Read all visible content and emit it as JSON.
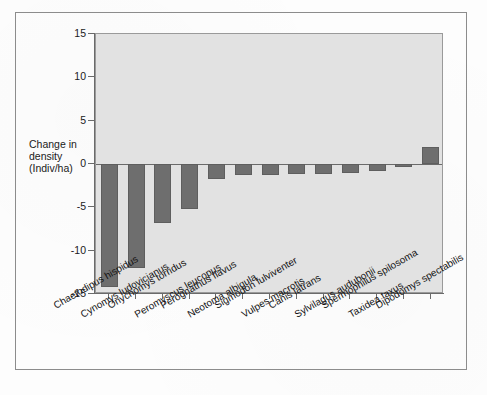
{
  "figure": {
    "background_color": "#fdfdfd",
    "plot_background_color": "#e2e2e2",
    "bar_color": "#6e6e6e",
    "axis_color": "#6a6a6a"
  },
  "axis": {
    "y_title_line1": "Change in",
    "y_title_line2": "density",
    "y_title_line3": "(Indiv/ha)"
  },
  "chart_data": {
    "type": "bar",
    "title": "",
    "xlabel": "",
    "ylabel": "Change in density (Indiv/ha)",
    "ylim": [
      -15,
      15
    ],
    "yticks": [
      15,
      10,
      5,
      0,
      -5,
      -10,
      -15
    ],
    "ytick_labels": [
      "15",
      "10",
      "5",
      "0",
      "-5",
      "-10",
      "-15"
    ],
    "grid": false,
    "legend": "none",
    "orientation": "vertical",
    "zero_reference_line": 0,
    "categories": [
      "Chaetodipus hispidus",
      "Cynomys ludovicianus",
      "Onychomys torridus",
      "Peromyscus leucopus",
      "Perognathus flavus",
      "Neotoma albigula",
      "Sigmodon fulviventer",
      "Vulpes macrotis",
      "Canis latrans",
      "Sylvilagus audubonii",
      "Spermophilus spilosoma",
      "Taxidea taxus",
      "Dipodomys spectabilis"
    ],
    "values": [
      -14.2,
      -12.0,
      -6.8,
      -5.2,
      -1.7,
      -1.3,
      -1.3,
      -1.2,
      -1.1,
      -1.0,
      -0.8,
      -0.3,
      2.0
    ]
  }
}
